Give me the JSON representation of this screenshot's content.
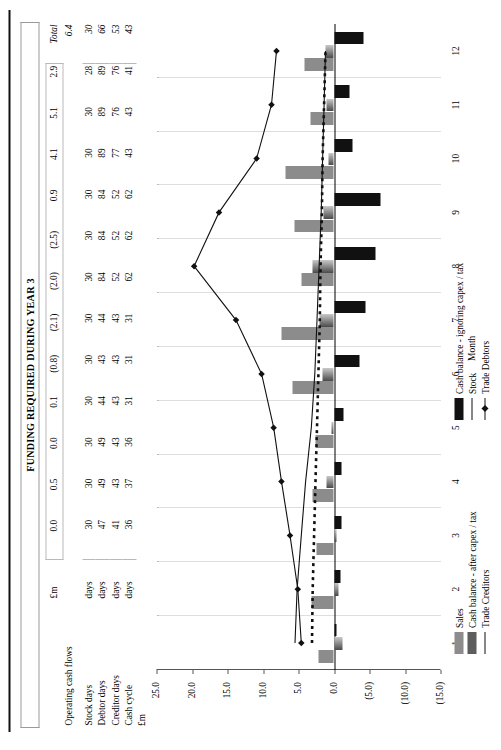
{
  "title": "FUNDING REQUIRED DURING YEAR 3",
  "table": {
    "unit_header": "£m",
    "total_header": "Total",
    "av_header": "Av",
    "month_headers": [
      "0.0",
      "0.5",
      "0.0",
      "0.1",
      "(0.8)",
      "(2.1)",
      "(2.0)",
      "(2.5)",
      "0.9",
      "4.1",
      "5.1",
      "2.9"
    ],
    "operating_label": "Operating cash flows",
    "operating_total": "6.4",
    "rows": [
      {
        "label": "Stock days",
        "unit": "days",
        "values": [
          "30",
          "30",
          "30",
          "30",
          "30",
          "30",
          "30",
          "30",
          "30",
          "30",
          "30",
          "28"
        ],
        "total": "30"
      },
      {
        "label": "Debtor days",
        "unit": "days",
        "values": [
          "47",
          "49",
          "49",
          "44",
          "43",
          "44",
          "84",
          "84",
          "84",
          "89",
          "89",
          "89"
        ],
        "total": "66"
      },
      {
        "label": "Creditor days",
        "unit": "days",
        "values": [
          "41",
          "43",
          "43",
          "43",
          "43",
          "43",
          "52",
          "52",
          "52",
          "77",
          "76",
          "76"
        ],
        "total": "53"
      },
      {
        "label": "Cash cycle",
        "unit": "days",
        "values": [
          "36",
          "37",
          "36",
          "31",
          "31",
          "31",
          "62",
          "62",
          "62",
          "43",
          "43",
          "41"
        ],
        "total": "43"
      }
    ]
  },
  "chart_data": {
    "type": "bar",
    "title": "FUNDING REQUIRED DURING YEAR 3",
    "xlabel": "Month",
    "ylabel": "£m",
    "categories": [
      "1",
      "2",
      "3",
      "4",
      "5",
      "6",
      "7",
      "8",
      "9",
      "10",
      "11",
      "12"
    ],
    "ylim": [
      -15.0,
      25.0
    ],
    "yticks": [
      "25.0",
      "20.0",
      "15.0",
      "10.0",
      "5.0",
      "0.0",
      "(5.0)",
      "(10.0)",
      "(15.0)"
    ],
    "ytick_values": [
      25.0,
      20.0,
      15.0,
      10.0,
      5.0,
      0.0,
      -5.0,
      -10.0,
      -15.0
    ],
    "grid": true,
    "legend_position": "bottom",
    "series": [
      {
        "name": "Sales",
        "type": "bar",
        "color": "#8c8c8c",
        "values": [
          2.2,
          3.1,
          2.4,
          3.0,
          2.6,
          5.9,
          7.4,
          4.6,
          5.6,
          6.8,
          3.3,
          4.2
        ]
      },
      {
        "name": "Cash balance - after capex / tax",
        "type": "bar",
        "color": "#6e6e6e",
        "values": [
          -1.2,
          -0.6,
          -0.4,
          1.0,
          0.4,
          1.6,
          2.1,
          3.0,
          1.5,
          0.8,
          1.0,
          1.2
        ]
      },
      {
        "name": "Trade Creditors",
        "type": "line",
        "color": "#111111",
        "values": [
          5.5,
          5.2,
          4.6,
          4.0,
          3.2,
          2.7,
          2.4,
          2.1,
          1.8,
          1.6,
          1.4,
          1.2
        ]
      },
      {
        "name": "Cash balance - ignoring capex / tax",
        "type": "bar",
        "color": "#111111",
        "values": [
          -0.4,
          -0.9,
          -1.0,
          -1.1,
          -1.4,
          -3.6,
          -4.4,
          -5.9,
          -6.6,
          -2.6,
          -2.2,
          -4.1
        ]
      },
      {
        "name": "Stock",
        "type": "dashed-line",
        "color": "#111111",
        "values": [
          3.1,
          3.0,
          2.8,
          2.6,
          2.4,
          2.2,
          2.0,
          1.9,
          1.7,
          1.6,
          1.4,
          1.2
        ]
      },
      {
        "name": "Trade Debtors",
        "type": "line-marker",
        "color": "#111111",
        "values": [
          4.6,
          5.1,
          6.2,
          7.4,
          8.5,
          10.2,
          13.8,
          19.7,
          16.2,
          10.9,
          8.8,
          8.1
        ]
      }
    ]
  },
  "legend_left": [
    {
      "label": "Sales",
      "style": "swatch-grey"
    },
    {
      "label": "Cash balance - after capex / tax",
      "style": "swatch-darkgrey"
    },
    {
      "label": "Trade Creditors",
      "style": "solid-line"
    }
  ],
  "legend_right": [
    {
      "label": "Cash balance - ignoring capex / tax",
      "style": "swatch-black"
    },
    {
      "label": "Stock",
      "style": "dashed-line"
    },
    {
      "label": "Trade Debtors",
      "style": "line-with-marker"
    }
  ],
  "axis": {
    "xtitle": "Month",
    "ytitle": "£m"
  }
}
